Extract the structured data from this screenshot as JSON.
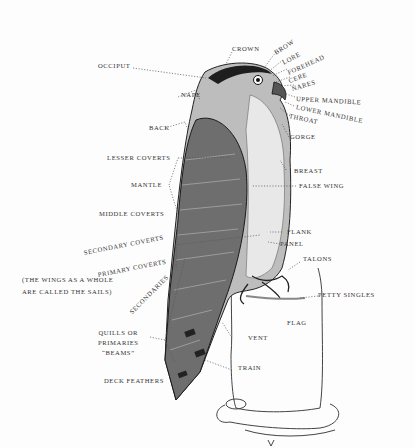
{
  "diagram": {
    "labels": {
      "crown": "CROWN",
      "brow": "BROW",
      "occiput": "OCCIPUT",
      "lore": "LORE",
      "forehead": "FOREHEAD",
      "cere": "CERE",
      "nares": "NARES",
      "nape": "NAPE",
      "upper_mandible": "UPPER MANDIBLE",
      "lower_mandible": "LOWER MANDIBLE",
      "throat": "THROAT",
      "back": "BACK",
      "gorge": "GORGE",
      "lesser_coverts": "LESSER COVERTS",
      "breast": "BREAST",
      "false_wing": "FALSE WING",
      "mantle": "MANTLE",
      "middle_coverts": "MIDDLE COVERTS",
      "secondary_coverts": "SECONDARY COVERTS",
      "flank": "FLANK",
      "panel": "PANEL",
      "primary_coverts": "PRIMARY COVERTS",
      "talons": "TALONS",
      "secondaries": "SECONDARIES",
      "petty_singles": "PETTY SINGLES",
      "flag": "FLAG",
      "quills_line1": "QUILLS OR",
      "quills_line2": "PRIMARIES",
      "quills_line3": "“BEAMS”",
      "vent": "VENT",
      "train": "TRAIN",
      "deck_feathers": "DECK FEATHERS"
    },
    "note": {
      "line1": "(THE WINGS AS A WHOLE",
      "line2": "ARE CALLED THE SAILS)"
    }
  }
}
